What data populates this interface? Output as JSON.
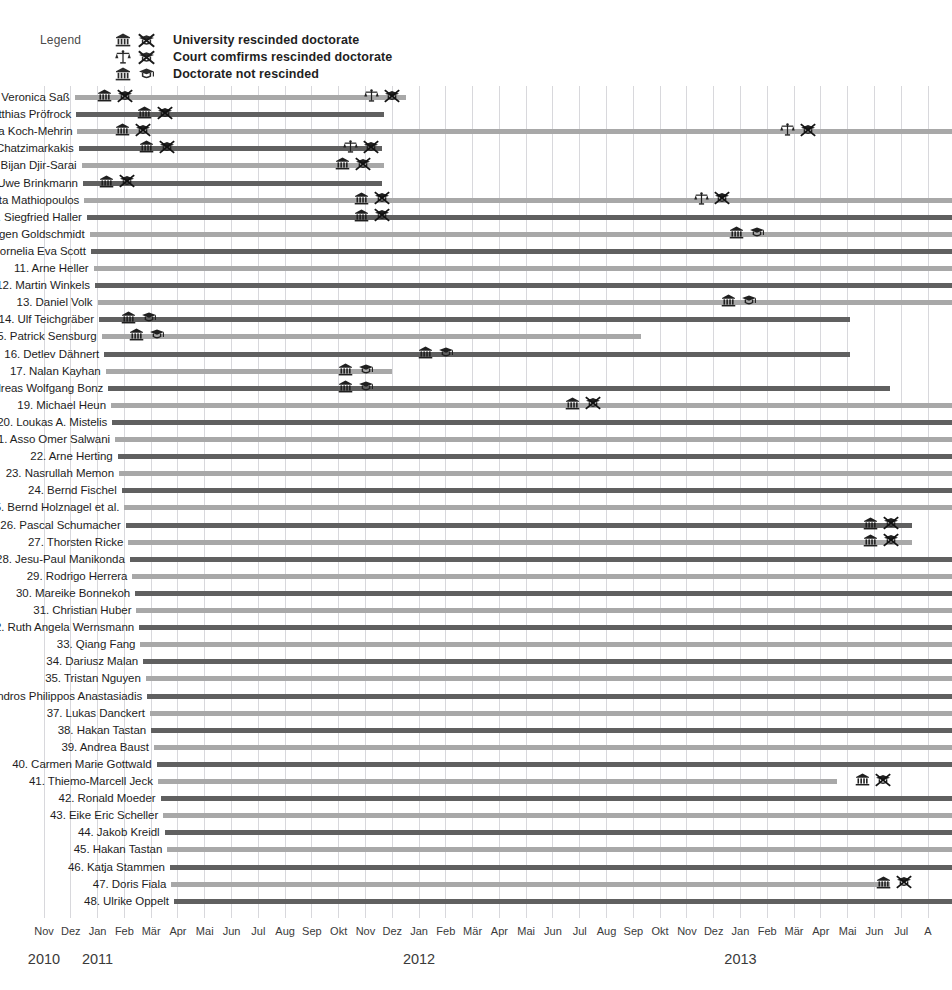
{
  "legend": {
    "title": "Legend",
    "entries": [
      {
        "icons": [
          "university-icon",
          "rescinded-doctorate-icon"
        ],
        "label": "University rescinded doctorate"
      },
      {
        "icons": [
          "court-scales-icon",
          "rescinded-doctorate-icon"
        ],
        "label": "Court comfirms rescinded doctorate"
      },
      {
        "icons": [
          "university-icon",
          "doctorate-icon"
        ],
        "label": "Doctorate not rescinded"
      }
    ]
  },
  "chart_data": {
    "type": "bar",
    "title": "",
    "subtitle": "",
    "xlabel": "",
    "ylabel": "",
    "orientation": "horizontal",
    "grid": true,
    "legend_position": "top-left",
    "x_axis": {
      "start": "2010-11",
      "end": "2013-08",
      "months": [
        "Nov",
        "Dez",
        "Jan",
        "Feb",
        "Mär",
        "Apr",
        "Mai",
        "Jun",
        "Jul",
        "Aug",
        "Sep",
        "Okt",
        "Nov",
        "Dez",
        "Jan",
        "Feb",
        "Mär",
        "Apr",
        "Mai",
        "Jun",
        "Jul",
        "Aug",
        "Sep",
        "Okt",
        "Nov",
        "Dez",
        "Jan",
        "Feb",
        "Mär",
        "Apr",
        "Mai",
        "Jun",
        "Jul",
        "A"
      ],
      "years": [
        {
          "label": "2010",
          "month_index": 0
        },
        {
          "label": "2011",
          "month_index": 2
        },
        {
          "label": "2012",
          "month_index": 14
        },
        {
          "label": "2013",
          "month_index": 26
        }
      ]
    },
    "colors": {
      "light_bar": "#a8a8a8",
      "dark_bar": "#606060",
      "gridline": "#d8d8dc",
      "text": "#1d1d1d"
    },
    "series_note": "Each row is a case: bar spans the months of the plagiarism case; markers show outcome events.",
    "rows": [
      {
        "n": 1,
        "name": "1. Veronica Saß",
        "shade": "light",
        "start": 1.15,
        "end": 13.5,
        "markers": [
          {
            "at": 2.3,
            "icons": [
              "university-icon",
              "rescinded-doctorate-icon"
            ]
          },
          {
            "at": 12.3,
            "icons": [
              "court-scales-icon",
              "rescinded-doctorate-icon"
            ]
          }
        ]
      },
      {
        "n": 2,
        "name": "2. Matthias Pröfrock",
        "shade": "dark",
        "start": 1.2,
        "end": 12.7,
        "markers": [
          {
            "at": 3.8,
            "icons": [
              "university-icon",
              "rescinded-doctorate-icon"
            ]
          }
        ]
      },
      {
        "n": 3,
        "name": "3. Silvana Koch-Mehrin",
        "shade": "light",
        "start": 1.25,
        "end": 33.9,
        "markers": [
          {
            "at": 3.0,
            "icons": [
              "university-icon",
              "rescinded-doctorate-icon"
            ]
          },
          {
            "at": 27.8,
            "icons": [
              "court-scales-icon",
              "rescinded-doctorate-icon"
            ]
          }
        ]
      },
      {
        "n": 4,
        "name": "4. Georgios Chatzimarkakis",
        "shade": "dark",
        "start": 1.3,
        "end": 12.6,
        "markers": [
          {
            "at": 3.9,
            "icons": [
              "university-icon",
              "rescinded-doctorate-icon"
            ]
          },
          {
            "at": 11.5,
            "icons": [
              "court-scales-icon",
              "rescinded-doctorate-icon"
            ]
          }
        ]
      },
      {
        "n": 5,
        "name": "5. Bijan Djir-Sarai",
        "shade": "light",
        "start": 1.4,
        "end": 12.7,
        "markers": [
          {
            "at": 11.2,
            "icons": [
              "university-icon",
              "rescinded-doctorate-icon"
            ]
          }
        ]
      },
      {
        "n": 6,
        "name": "6. Uwe Brinkmann",
        "shade": "dark",
        "start": 1.45,
        "end": 12.6,
        "markers": [
          {
            "at": 2.4,
            "icons": [
              "university-icon",
              "rescinded-doctorate-icon"
            ]
          }
        ]
      },
      {
        "n": 7,
        "name": "7. Margarita Mathiopoulos",
        "shade": "light",
        "start": 1.5,
        "end": 33.9,
        "markers": [
          {
            "at": 11.9,
            "icons": [
              "university-icon",
              "rescinded-doctorate-icon"
            ]
          },
          {
            "at": 24.6,
            "icons": [
              "court-scales-icon",
              "rescinded-doctorate-icon"
            ]
          }
        ]
      },
      {
        "n": 8,
        "name": "8. Siegfried Haller",
        "shade": "dark",
        "start": 1.6,
        "end": 33.9,
        "markers": [
          {
            "at": 11.9,
            "icons": [
              "university-icon",
              "rescinded-doctorate-icon"
            ]
          }
        ]
      },
      {
        "n": 9,
        "name": "9. Jürgen Goldschmidt",
        "shade": "light",
        "start": 1.7,
        "end": 33.9,
        "markers": [
          {
            "at": 25.9,
            "icons": [
              "university-icon",
              "doctorate-icon"
            ]
          }
        ]
      },
      {
        "n": 10,
        "name": "10. Cornelia Eva Scott",
        "shade": "dark",
        "start": 1.75,
        "end": 33.9,
        "markers": []
      },
      {
        "n": 11,
        "name": "11. Arne Heller",
        "shade": "light",
        "start": 1.85,
        "end": 33.9,
        "markers": []
      },
      {
        "n": 12,
        "name": "12. Martin Winkels",
        "shade": "dark",
        "start": 1.9,
        "end": 33.9,
        "markers": []
      },
      {
        "n": 13,
        "name": "13. Daniel Volk",
        "shade": "light",
        "start": 2.0,
        "end": 33.9,
        "markers": [
          {
            "at": 25.6,
            "icons": [
              "university-icon",
              "doctorate-icon"
            ]
          }
        ]
      },
      {
        "n": 14,
        "name": "14. Ulf Teichgräber",
        "shade": "dark",
        "start": 2.05,
        "end": 30.1,
        "markers": [
          {
            "at": 3.2,
            "icons": [
              "university-icon",
              "doctorate-icon"
            ]
          }
        ]
      },
      {
        "n": 15,
        "name": "15. Patrick Sensburg",
        "shade": "light",
        "start": 2.15,
        "end": 22.3,
        "markers": [
          {
            "at": 3.5,
            "icons": [
              "university-icon",
              "doctorate-icon"
            ]
          }
        ]
      },
      {
        "n": 16,
        "name": "16. Detlev Dähnert",
        "shade": "dark",
        "start": 2.25,
        "end": 30.1,
        "markers": [
          {
            "at": 14.3,
            "icons": [
              "university-icon",
              "doctorate-icon"
            ]
          }
        ]
      },
      {
        "n": 17,
        "name": "17. Nalan Kayhan",
        "shade": "light",
        "start": 2.3,
        "end": 13.0,
        "markers": [
          {
            "at": 11.3,
            "icons": [
              "university-icon",
              "doctorate-icon"
            ]
          }
        ]
      },
      {
        "n": 18,
        "name": "18. Andreas Wolfgang Bonz",
        "shade": "dark",
        "start": 2.4,
        "end": 31.6,
        "markers": [
          {
            "at": 11.3,
            "icons": [
              "university-icon",
              "doctorate-icon"
            ]
          }
        ]
      },
      {
        "n": 19,
        "name": "19. Michael Heun",
        "shade": "light",
        "start": 2.5,
        "end": 33.9,
        "markers": [
          {
            "at": 19.8,
            "icons": [
              "university-icon",
              "rescinded-doctorate-icon"
            ]
          }
        ]
      },
      {
        "n": 20,
        "name": "20. Loukas A. Mistelis",
        "shade": "dark",
        "start": 2.55,
        "end": 33.9,
        "markers": []
      },
      {
        "n": 21,
        "name": "21. Asso Omer Salwani",
        "shade": "light",
        "start": 2.65,
        "end": 33.9,
        "markers": []
      },
      {
        "n": 22,
        "name": "22. Arne Herting",
        "shade": "dark",
        "start": 2.75,
        "end": 33.9,
        "markers": []
      },
      {
        "n": 23,
        "name": "23. Nasrullah Memon",
        "shade": "light",
        "start": 2.8,
        "end": 33.9,
        "markers": []
      },
      {
        "n": 24,
        "name": "24. Bernd Fischel",
        "shade": "dark",
        "start": 2.9,
        "end": 33.9,
        "markers": []
      },
      {
        "n": 25,
        "name": "25. Bernd Holznagel et al.",
        "shade": "light",
        "start": 3.0,
        "end": 33.9,
        "markers": []
      },
      {
        "n": 26,
        "name": "26. Pascal Schumacher",
        "shade": "dark",
        "start": 3.05,
        "end": 32.4,
        "markers": [
          {
            "at": 30.9,
            "icons": [
              "university-icon",
              "rescinded-doctorate-icon"
            ]
          }
        ]
      },
      {
        "n": 27,
        "name": "27. Thorsten Ricke",
        "shade": "light",
        "start": 3.15,
        "end": 32.4,
        "markers": [
          {
            "at": 30.9,
            "icons": [
              "university-icon",
              "rescinded-doctorate-icon"
            ]
          }
        ]
      },
      {
        "n": 28,
        "name": "28. Jesu-Paul Manikonda",
        "shade": "dark",
        "start": 3.2,
        "end": 33.9,
        "markers": []
      },
      {
        "n": 29,
        "name": "29. Rodrigo Herrera",
        "shade": "light",
        "start": 3.3,
        "end": 33.9,
        "markers": []
      },
      {
        "n": 30,
        "name": "30. Mareike Bonnekoh",
        "shade": "dark",
        "start": 3.4,
        "end": 33.9,
        "markers": []
      },
      {
        "n": 31,
        "name": "31. Christian Huber",
        "shade": "light",
        "start": 3.45,
        "end": 33.9,
        "markers": []
      },
      {
        "n": 32,
        "name": "32. Ruth Angela Wernsmann",
        "shade": "dark",
        "start": 3.55,
        "end": 33.9,
        "markers": []
      },
      {
        "n": 33,
        "name": "33. Qiang Fang",
        "shade": "light",
        "start": 3.6,
        "end": 33.9,
        "markers": []
      },
      {
        "n": 34,
        "name": "34. Dariusz Malan",
        "shade": "dark",
        "start": 3.7,
        "end": 33.9,
        "markers": []
      },
      {
        "n": 35,
        "name": "35. Tristan Nguyen",
        "shade": "light",
        "start": 3.8,
        "end": 33.9,
        "markers": []
      },
      {
        "n": 36,
        "name": "36. Alexandros Philippos Anastasiadis",
        "shade": "dark",
        "start": 3.85,
        "end": 33.9,
        "markers": []
      },
      {
        "n": 37,
        "name": "37. Lukas Danckert",
        "shade": "light",
        "start": 3.95,
        "end": 33.9,
        "markers": []
      },
      {
        "n": 38,
        "name": "38. Hakan Tastan",
        "shade": "dark",
        "start": 4.0,
        "end": 33.9,
        "markers": []
      },
      {
        "n": 39,
        "name": "39. Andrea Baust",
        "shade": "light",
        "start": 4.1,
        "end": 33.9,
        "markers": []
      },
      {
        "n": 40,
        "name": "40. Carmen Marie Gottwald",
        "shade": "dark",
        "start": 4.2,
        "end": 33.9,
        "markers": []
      },
      {
        "n": 41,
        "name": "41. Thiemo-Marcell Jeck",
        "shade": "light",
        "start": 4.25,
        "end": 29.6,
        "markers": [
          {
            "at": 30.6,
            "icons": [
              "university-icon",
              "rescinded-doctorate-icon"
            ]
          }
        ]
      },
      {
        "n": 42,
        "name": "42. Ronald Moeder",
        "shade": "dark",
        "start": 4.35,
        "end": 33.9,
        "markers": []
      },
      {
        "n": 43,
        "name": "43. Eike Eric Scheller",
        "shade": "light",
        "start": 4.45,
        "end": 33.9,
        "markers": []
      },
      {
        "n": 44,
        "name": "44. Jakob Kreidl",
        "shade": "dark",
        "start": 4.5,
        "end": 33.9,
        "markers": []
      },
      {
        "n": 45,
        "name": "45. Hakan Tastan",
        "shade": "light",
        "start": 4.6,
        "end": 33.9,
        "markers": []
      },
      {
        "n": 46,
        "name": "46. Katja Stammen",
        "shade": "dark",
        "start": 4.7,
        "end": 33.9,
        "markers": []
      },
      {
        "n": 47,
        "name": "47. Doris Fiala",
        "shade": "light",
        "start": 4.75,
        "end": 31.6,
        "markers": [
          {
            "at": 31.4,
            "icons": [
              "university-icon",
              "rescinded-doctorate-icon"
            ]
          }
        ]
      },
      {
        "n": 48,
        "name": "48. Ulrike Oppelt",
        "shade": "dark",
        "start": 4.85,
        "end": 33.9,
        "markers": []
      }
    ]
  }
}
